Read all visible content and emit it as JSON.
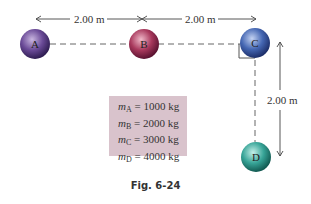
{
  "figure": {
    "caption": "Fig. 6-24",
    "balls": [
      {
        "id": "A",
        "label": "A",
        "color": "#5b3c86"
      },
      {
        "id": "B",
        "label": "B",
        "color": "#9a2f52"
      },
      {
        "id": "C",
        "label": "C",
        "color": "#3d5ca8"
      },
      {
        "id": "D",
        "label": "D",
        "color": "#2f9a8f"
      }
    ],
    "distances": {
      "ab": "2.00 m",
      "bc": "2.00 m",
      "cd": "2.00 m"
    },
    "masses": [
      {
        "symbol": "m",
        "sub": "A",
        "value": "= 1000 kg"
      },
      {
        "symbol": "m",
        "sub": "B",
        "value": "= 2000 kg"
      },
      {
        "symbol": "m",
        "sub": "C",
        "value": "= 3000 kg"
      },
      {
        "symbol": "m",
        "sub": "D",
        "value": "= 4000 kg"
      }
    ],
    "mass_box_color": "#d9c3cc"
  }
}
